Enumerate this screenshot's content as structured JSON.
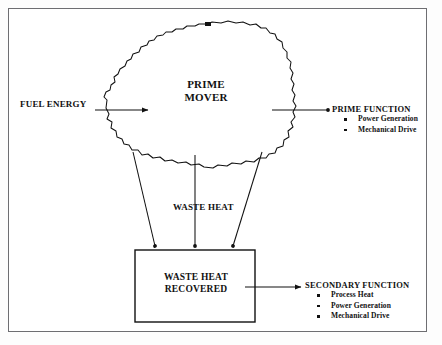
{
  "diagram": {
    "input": {
      "label": "FUEL ENERGY"
    },
    "prime_mover": {
      "line1": "PRIME",
      "line2": "MOVER"
    },
    "waste_heat": {
      "label": "WASTE HEAT"
    },
    "waste_heat_recovered": {
      "line1": "WASTE HEAT",
      "line2": "RECOVERED"
    },
    "prime_function": {
      "title": "PRIME FUNCTION",
      "items": [
        "Power Generation",
        "Mechanical Drive"
      ]
    },
    "secondary_function": {
      "title": "SECONDARY FUNCTION",
      "items": [
        "Process Heat",
        "Power Generation",
        "Mechanical Drive"
      ]
    },
    "colors": {
      "ink": "#111111",
      "frame": "#6e6e72",
      "paper": "#ffffff"
    }
  }
}
